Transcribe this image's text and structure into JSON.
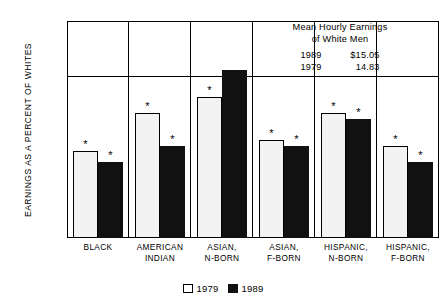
{
  "chart_data": {
    "type": "bar",
    "title": "",
    "xlabel": "",
    "ylabel": "EARNINGS AS A PERCENT OF WHITES",
    "ylim": [
      70,
      110
    ],
    "yticks": [
      "70%",
      "80%",
      "90%",
      "100%",
      "110%"
    ],
    "ytick_values": [
      70,
      80,
      90,
      100,
      110
    ],
    "grid": "horizontal gridline at 100%",
    "legend_position": "bottom-center",
    "categories": [
      "BLACK",
      "AMERICAN INDIAN",
      "ASIAN, N-BORN",
      "ASIAN, F-BORN",
      "HISPANIC, N-BORN",
      "HISPANIC, F-BORN"
    ],
    "category_lines": [
      [
        "BLACK",
        ""
      ],
      [
        "AMERICAN",
        "INDIAN"
      ],
      [
        "ASIAN,",
        "N-BORN"
      ],
      [
        "ASIAN,",
        "F-BORN"
      ],
      [
        "HISPANIC,",
        "N-BORN"
      ],
      [
        "HISPANIC,",
        "F-BORN"
      ]
    ],
    "series": [
      {
        "name": "1979",
        "color": "#f2f2f2",
        "values": [
          86,
          93,
          96,
          88,
          93,
          87
        ],
        "annotations": [
          "*",
          "*",
          "*",
          "*",
          "*",
          "*"
        ]
      },
      {
        "name": "1989",
        "color": "#111111",
        "values": [
          84,
          87,
          101,
          87,
          92,
          84
        ],
        "annotations": [
          "*",
          "*",
          "",
          "*",
          "*",
          "*"
        ]
      }
    ],
    "annotation_note": "* denotes statistically significant marker above bar"
  },
  "legend": {
    "items": [
      {
        "label": "1979",
        "swatch": "white-square"
      },
      {
        "label": "1989",
        "swatch": "black-square"
      }
    ]
  },
  "note_box": {
    "title_line1": "Mean Hourly Earnings",
    "title_line2": "of White Men",
    "rows": [
      {
        "year": "1989",
        "value": "$15.05"
      },
      {
        "year": "1979",
        "value": "14.83"
      }
    ]
  }
}
